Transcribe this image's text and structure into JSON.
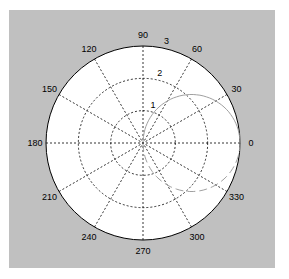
{
  "chart_data": {
    "type": "polar",
    "title": "",
    "radial_ticks": [
      1,
      2,
      3
    ],
    "radial_tick_labels": [
      "1",
      "2",
      "3"
    ],
    "rlim": [
      0,
      3
    ],
    "angle_ticks": [
      0,
      30,
      60,
      90,
      120,
      150,
      180,
      210,
      240,
      270,
      300,
      330
    ],
    "angle_tick_labels": [
      "0",
      "30",
      "60",
      "90",
      "120",
      "150",
      "180",
      "210",
      "240",
      "270",
      "300",
      "330"
    ],
    "grid": true,
    "series": [
      {
        "name": "upper",
        "style": "solid",
        "equation": "r = 3*cos(theta)",
        "theta_range_deg": [
          0,
          90
        ],
        "points": [
          [
            0,
            3.0
          ],
          [
            15,
            2.9
          ],
          [
            30,
            2.6
          ],
          [
            45,
            2.12
          ],
          [
            60,
            1.5
          ],
          [
            75,
            0.78
          ],
          [
            90,
            0
          ]
        ]
      },
      {
        "name": "lower",
        "style": "dashed",
        "equation": "r = 3*cos(theta)",
        "theta_range_deg": [
          270,
          360
        ],
        "points": [
          [
            270,
            0
          ],
          [
            285,
            0.78
          ],
          [
            300,
            1.5
          ],
          [
            315,
            2.12
          ],
          [
            330,
            2.6
          ],
          [
            345,
            2.9
          ],
          [
            360,
            3.0
          ]
        ]
      }
    ]
  },
  "colors": {
    "background": "#c0c0c0",
    "plot_area": "#ffffff",
    "grid": "#000000",
    "curve": "#a0a0a0"
  }
}
